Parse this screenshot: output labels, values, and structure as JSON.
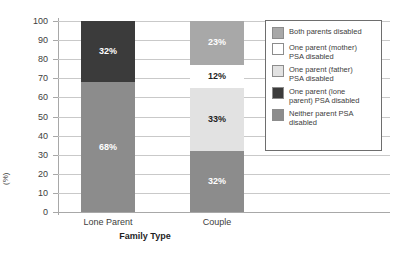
{
  "chart_data": {
    "type": "bar",
    "subtype": "stacked-bar-100",
    "title": "",
    "xlabel": "Family Type",
    "ylabel": "(%)",
    "categories": [
      "Lone Parent",
      "Couple"
    ],
    "ylim": [
      0,
      100
    ],
    "ytick_labels": [
      "100",
      "90",
      "80",
      "70",
      "60",
      "50",
      "40",
      "30",
      "20",
      "10",
      "0"
    ],
    "ytick_values": [
      100,
      90,
      80,
      70,
      60,
      50,
      40,
      30,
      20,
      10,
      0
    ],
    "grid": true,
    "legend_position": "inside-right",
    "series": [
      {
        "name": "Neither parent PSA disabled",
        "color": "#8c8c8c",
        "values": [
          68,
          32
        ],
        "labels": [
          "68%",
          "32%"
        ],
        "label_color": "light"
      },
      {
        "name": "One parent (father) PSA disabled",
        "color": "#e2e2e2",
        "values": [
          0,
          33
        ],
        "labels": [
          "",
          "33%"
        ],
        "label_color": "dark"
      },
      {
        "name": "One parent (mother) PSA disabled",
        "color": "#ffffff",
        "values": [
          0,
          12
        ],
        "labels": [
          "",
          "12%"
        ],
        "label_color": "dark"
      },
      {
        "name": "Both parents disabled",
        "color": "#a8a8a8",
        "values": [
          0,
          23
        ],
        "labels": [
          "",
          "23%"
        ],
        "label_color": "light"
      },
      {
        "name": "One parent (lone parent) PSA disabled",
        "color": "#3b3b3b",
        "values": [
          32,
          0
        ],
        "labels": [
          "32%",
          ""
        ],
        "label_color": "light"
      }
    ],
    "bars": [
      {
        "category": "Lone Parent",
        "segments": [
          {
            "series": "Neither parent PSA disabled",
            "value": 68,
            "label": "68%",
            "color": "#8c8c8c",
            "label_color": "light"
          },
          {
            "series": "One parent (lone parent) PSA disabled",
            "value": 32,
            "label": "32%",
            "color": "#3b3b3b",
            "label_color": "light"
          }
        ]
      },
      {
        "category": "Couple",
        "segments": [
          {
            "series": "Neither parent PSA disabled",
            "value": 32,
            "label": "32%",
            "color": "#8c8c8c",
            "label_color": "light"
          },
          {
            "series": "One parent (father) PSA disabled",
            "value": 33,
            "label": "33%",
            "color": "#e2e2e2",
            "label_color": "dark"
          },
          {
            "series": "One parent (mother) PSA disabled",
            "value": 12,
            "label": "12%",
            "color": "#ffffff",
            "label_color": "dark"
          },
          {
            "series": "Both parents disabled",
            "value": 23,
            "label": "23%",
            "color": "#a8a8a8",
            "label_color": "light"
          }
        ]
      }
    ],
    "legend": [
      {
        "label": "Both parents disabled",
        "color": "#a8a8a8"
      },
      {
        "label": "One parent (mother)\nPSA disabled",
        "color": "#ffffff"
      },
      {
        "label": "One parent (father)\nPSA disabled",
        "color": "#e2e2e2"
      },
      {
        "label": "One parent (lone\nparent) PSA disabled",
        "color": "#3b3b3b"
      },
      {
        "label": "Neither parent PSA\ndisabled",
        "color": "#8c8c8c"
      }
    ],
    "colors": {
      "grid": "#c9c9c9",
      "axis": "#a8a8a8",
      "text": "#3d3d3d",
      "legend_border": "#6e6e6e",
      "background": "#ffffff"
    }
  }
}
